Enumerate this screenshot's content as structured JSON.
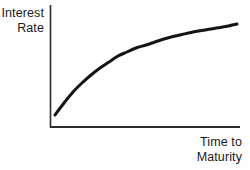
{
  "figure": {
    "background_color": "#fefefe",
    "ink_color": "#1a1a1a"
  },
  "axes": {
    "y_axis_label": "Interest\nRate",
    "x_axis_label": "Time to\nMaturity",
    "axis_color": "#2b2b2b",
    "origin_px": [
      50,
      127
    ],
    "x_axis_end_px": [
      240,
      127
    ],
    "y_axis_top_px": [
      50,
      5
    ]
  },
  "chart_data": {
    "type": "line",
    "title": "",
    "subtitle": "",
    "xlabel": "Time to Maturity",
    "ylabel": "Interest Rate",
    "grid": false,
    "legend": false,
    "legend_position": "none",
    "axis_ticks": {
      "x": [],
      "y": []
    },
    "xlim": [
      0,
      1
    ],
    "ylim": [
      0,
      1
    ],
    "annotations": [],
    "series": [
      {
        "name": "Yield Curve",
        "shape": "concave-increasing",
        "color": "#141414",
        "line_width_px": 3,
        "x": [
          0.0,
          0.05,
          0.1,
          0.15,
          0.2,
          0.25,
          0.3,
          0.35,
          0.4,
          0.45,
          0.5,
          0.55,
          0.6,
          0.65,
          0.7,
          0.75,
          0.8,
          0.85,
          0.9,
          0.95,
          1.0
        ],
        "y": [
          0.0,
          0.13,
          0.25,
          0.35,
          0.44,
          0.52,
          0.59,
          0.65,
          0.7,
          0.745,
          0.785,
          0.82,
          0.85,
          0.877,
          0.9,
          0.92,
          0.938,
          0.954,
          0.968,
          0.981,
          1.0
        ],
        "px": [
          [
            55,
            115
          ],
          [
            64,
            103
          ],
          [
            73,
            92
          ],
          [
            82,
            83
          ],
          [
            91,
            75
          ],
          [
            100,
            68
          ],
          [
            109,
            62
          ],
          [
            118,
            56
          ],
          [
            127,
            52
          ],
          [
            136,
            48
          ],
          [
            146,
            45
          ],
          [
            155,
            42
          ],
          [
            164,
            39
          ],
          [
            173,
            36.5
          ],
          [
            182,
            34.5
          ],
          [
            191,
            32.5
          ],
          [
            200,
            30.8
          ],
          [
            209,
            29.2
          ],
          [
            218,
            27.8
          ],
          [
            227,
            26.3
          ],
          [
            237,
            24
          ]
        ]
      }
    ]
  }
}
